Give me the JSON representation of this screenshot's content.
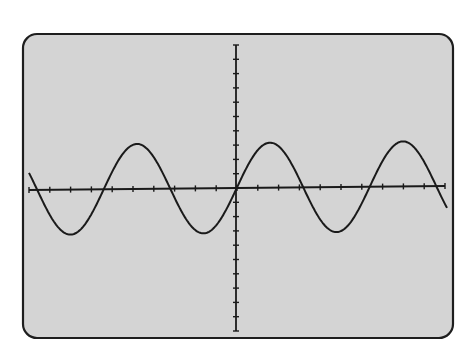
{
  "figure": {
    "colors": {
      "background": "#ffffff",
      "screen_fill": "#d4d4d4",
      "screen_border": "#1e1e1e",
      "trace": "#1a1a1a",
      "axes": "#1a1a1a"
    },
    "screen": {
      "x": 23,
      "y": 34,
      "width": 430,
      "height": 304,
      "corner_radius": 14
    },
    "axes": {
      "vertical": {
        "x": 236,
        "y_top": 45,
        "y_bottom": 331,
        "tick_count": 21
      },
      "horizontal": {
        "x_left": 29,
        "y_left": 190,
        "x_right": 445,
        "y_right": 186,
        "tick_count": 21
      }
    },
    "waveform": {
      "type": "sine",
      "x_start": 29,
      "x_end": 447,
      "period_px": 133,
      "amplitude_px": 45,
      "peaks_x": [
        138,
        270,
        403
      ],
      "troughs_x": [
        73,
        206,
        337
      ],
      "cycles_visible": 3.15
    }
  }
}
